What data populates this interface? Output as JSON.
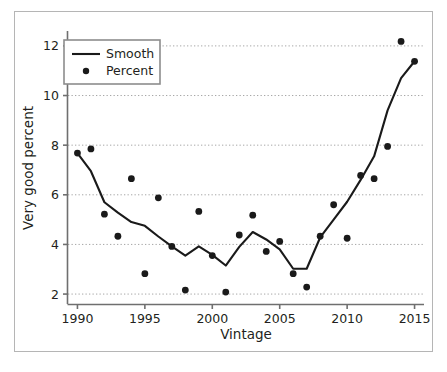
{
  "chart_data": {
    "type": "scatter",
    "title": "",
    "xlabel": "Vintage",
    "ylabel": "Very good percent",
    "xlim": [
      1989.3,
      2015.7
    ],
    "ylim": [
      1.6,
      12.6
    ],
    "xticks": [
      1990,
      1995,
      2000,
      2005,
      2010,
      2015
    ],
    "yticks": [
      2,
      4,
      6,
      8,
      10,
      12
    ],
    "grid": "horizontal-dotted",
    "legend_position": "upper-left",
    "legend": [
      {
        "name": "Smooth",
        "marker": "line"
      },
      {
        "name": "Percent",
        "marker": "dot"
      }
    ],
    "x": [
      1990,
      1991,
      1992,
      1993,
      1994,
      1995,
      1996,
      1997,
      1998,
      1999,
      2000,
      2001,
      2002,
      2003,
      2004,
      2005,
      2006,
      2007,
      2008,
      2009,
      2010,
      2011,
      2012,
      2013,
      2014,
      2015
    ],
    "series": [
      {
        "name": "Percent",
        "type": "scatter",
        "marker": "dot",
        "color": "#1a1a1a",
        "values": [
          7.68,
          7.85,
          5.22,
          4.33,
          6.65,
          2.82,
          5.88,
          3.92,
          2.16,
          5.33,
          3.55,
          2.08,
          4.38,
          5.18,
          3.72,
          4.12,
          2.82,
          2.28,
          4.33,
          5.6,
          4.25,
          6.78,
          6.65,
          7.95,
          12.18,
          11.38
        ]
      },
      {
        "name": "Smooth",
        "type": "line",
        "color": "#1a1a1a",
        "values": [
          7.68,
          6.95,
          5.7,
          5.28,
          4.9,
          4.75,
          4.32,
          3.92,
          3.55,
          3.92,
          3.58,
          3.15,
          3.9,
          4.5,
          4.2,
          3.8,
          3.02,
          3.02,
          4.28,
          5.0,
          5.72,
          6.6,
          7.55,
          9.4,
          10.7,
          11.38
        ]
      }
    ]
  },
  "axis": {
    "x_tick_labels": [
      "1990",
      "1995",
      "2000",
      "2005",
      "2010",
      "2015"
    ],
    "y_tick_labels": [
      "2",
      "4",
      "6",
      "8",
      "10",
      "12"
    ],
    "x_title": "Vintage",
    "y_title": "Very good percent"
  },
  "legend": {
    "smooth_label": "Smooth",
    "percent_label": "Percent"
  },
  "colors": {
    "data": "#1a1a1a",
    "axis": "#6f6f6f",
    "grid": "#9c9c9c",
    "frame": "#b5b5b5",
    "background": "#ffffff"
  }
}
